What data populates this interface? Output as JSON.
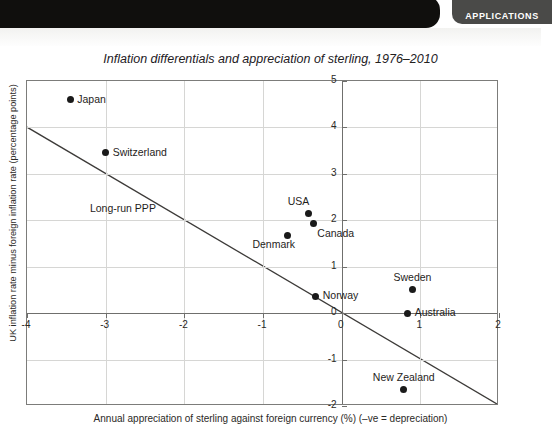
{
  "header": {
    "tab_label": "APPLICATIONS"
  },
  "figure": {
    "title": "Inflation differentials and appreciation of sterling, 1976–2010",
    "xlabel": "Annual appreciation of sterling against foreign currency (%) (–ve = depreciation)",
    "ylabel": "UK inflation rate minus foreign inflation rate (percentage points)"
  },
  "chart_data": {
    "type": "scatter",
    "title": "Inflation differentials and appreciation of sterling, 1976–2010",
    "xlabel": "Annual appreciation of sterling against foreign currency (%) (–ve = depreciation)",
    "ylabel": "UK inflation rate minus foreign inflation rate (percentage points)",
    "xlim": [
      -4,
      2
    ],
    "ylim": [
      -2,
      5
    ],
    "xticks": [
      "-4",
      "-3",
      "-2",
      "-1",
      "0",
      "1",
      "2"
    ],
    "yticks": [
      "5",
      "4",
      "3",
      "2",
      "1",
      "0",
      "-1",
      "-2"
    ],
    "xtick_values": [
      -4,
      -3,
      -2,
      -1,
      0,
      1,
      2
    ],
    "ytick_values": [
      5,
      4,
      3,
      2,
      1,
      0,
      -1,
      -2
    ],
    "grid": true,
    "legend": "none",
    "points": [
      {
        "label": "Japan",
        "x": -3.45,
        "y": 4.6,
        "label_pos": "right"
      },
      {
        "label": "Switzerland",
        "x": -3.0,
        "y": 3.45,
        "label_pos": "right"
      },
      {
        "label": "USA",
        "x": -0.42,
        "y": 2.15,
        "label_pos": "above-left"
      },
      {
        "label": "Canada",
        "x": -0.36,
        "y": 1.93,
        "label_pos": "below-right"
      },
      {
        "label": "Denmark",
        "x": -0.69,
        "y": 1.68,
        "label_pos": "below-left"
      },
      {
        "label": "Norway",
        "x": -0.33,
        "y": 0.36,
        "label_pos": "right"
      },
      {
        "label": "Sweden",
        "x": 0.9,
        "y": 0.5,
        "label_pos": "above"
      },
      {
        "label": "Australia",
        "x": 0.84,
        "y": 0.0,
        "label_pos": "right"
      },
      {
        "label": "New Zealand",
        "x": 0.79,
        "y": -1.65,
        "label_pos": "above"
      }
    ],
    "annotations": [
      {
        "label": "Long-run PPP",
        "type": "line",
        "line_from": [
          -4,
          4.0
        ],
        "line_to": [
          2,
          -2.0
        ],
        "label_x": -3.2,
        "label_y": 2.25
      }
    ]
  }
}
